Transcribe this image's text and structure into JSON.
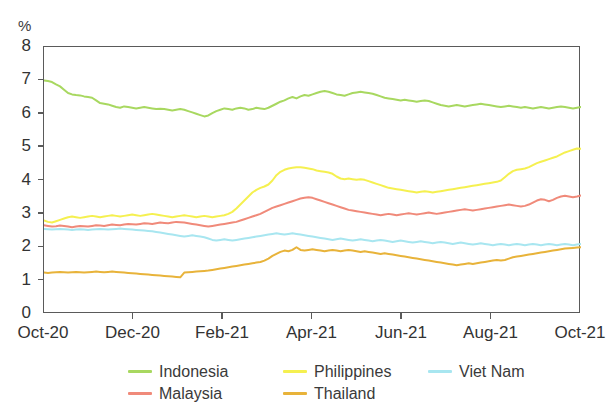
{
  "unit_label": "%",
  "chart_data": {
    "type": "line",
    "title": "",
    "subtitle": "",
    "xlabel": "",
    "ylabel": "%",
    "ylim": [
      0,
      8
    ],
    "ytick_labels": [
      "0",
      "1",
      "2",
      "3",
      "4",
      "5",
      "6",
      "7",
      "8"
    ],
    "ytick_values": [
      0,
      1,
      2,
      3,
      4,
      5,
      6,
      7,
      8
    ],
    "xtick_labels": [
      "Oct-20",
      "Dec-20",
      "Feb-21",
      "Apr-21",
      "Jun-21",
      "Aug-21",
      "Oct-21"
    ],
    "xtick_positions": [
      0,
      2,
      4,
      6,
      8,
      10,
      12
    ],
    "xlim": [
      0,
      12
    ],
    "grid": false,
    "legend_position": "bottom",
    "series": [
      {
        "name": "Indonesia",
        "color": "#a8d860",
        "values": [
          7.0,
          6.98,
          6.95,
          6.88,
          6.82,
          6.72,
          6.62,
          6.58,
          6.56,
          6.55,
          6.52,
          6.5,
          6.48,
          6.4,
          6.32,
          6.3,
          6.28,
          6.24,
          6.2,
          6.18,
          6.22,
          6.2,
          6.18,
          6.16,
          6.18,
          6.2,
          6.18,
          6.16,
          6.14,
          6.15,
          6.14,
          6.12,
          6.1,
          6.12,
          6.14,
          6.12,
          6.08,
          6.04,
          6.0,
          5.96,
          5.92,
          5.95,
          6.02,
          6.08,
          6.12,
          6.16,
          6.14,
          6.12,
          6.16,
          6.18,
          6.16,
          6.12,
          6.14,
          6.18,
          6.16,
          6.14,
          6.18,
          6.24,
          6.3,
          6.36,
          6.4,
          6.46,
          6.5,
          6.46,
          6.52,
          6.56,
          6.54,
          6.58,
          6.62,
          6.66,
          6.68,
          6.66,
          6.62,
          6.58,
          6.56,
          6.54,
          6.58,
          6.62,
          6.64,
          6.66,
          6.64,
          6.62,
          6.6,
          6.56,
          6.52,
          6.48,
          6.46,
          6.44,
          6.42,
          6.4,
          6.42,
          6.4,
          6.38,
          6.36,
          6.38,
          6.4,
          6.38,
          6.34,
          6.3,
          6.26,
          6.24,
          6.22,
          6.24,
          6.26,
          6.24,
          6.22,
          6.24,
          6.26,
          6.28,
          6.3,
          6.28,
          6.26,
          6.24,
          6.22,
          6.2,
          6.22,
          6.24,
          6.22,
          6.2,
          6.18,
          6.2,
          6.18,
          6.16,
          6.18,
          6.2,
          6.18,
          6.16,
          6.18,
          6.2,
          6.22,
          6.2,
          6.18,
          6.16,
          6.18,
          6.2
        ]
      },
      {
        "name": "Malaysia",
        "color": "#f08a7a",
        "values": [
          2.66,
          2.64,
          2.62,
          2.63,
          2.65,
          2.64,
          2.62,
          2.6,
          2.62,
          2.64,
          2.63,
          2.62,
          2.64,
          2.66,
          2.65,
          2.64,
          2.66,
          2.68,
          2.67,
          2.66,
          2.68,
          2.7,
          2.69,
          2.68,
          2.7,
          2.72,
          2.71,
          2.7,
          2.72,
          2.74,
          2.73,
          2.72,
          2.74,
          2.76,
          2.75,
          2.74,
          2.72,
          2.7,
          2.68,
          2.66,
          2.64,
          2.62,
          2.64,
          2.66,
          2.68,
          2.7,
          2.72,
          2.74,
          2.76,
          2.8,
          2.84,
          2.88,
          2.92,
          2.96,
          3.0,
          3.06,
          3.12,
          3.18,
          3.22,
          3.26,
          3.3,
          3.34,
          3.38,
          3.42,
          3.46,
          3.48,
          3.5,
          3.48,
          3.44,
          3.4,
          3.36,
          3.32,
          3.28,
          3.24,
          3.2,
          3.16,
          3.12,
          3.1,
          3.08,
          3.06,
          3.04,
          3.02,
          3.0,
          2.98,
          2.96,
          2.98,
          3.0,
          2.98,
          2.96,
          2.98,
          3.0,
          3.02,
          3.0,
          2.98,
          3.0,
          3.02,
          3.04,
          3.02,
          3.0,
          3.02,
          3.04,
          3.06,
          3.08,
          3.1,
          3.12,
          3.14,
          3.12,
          3.1,
          3.12,
          3.14,
          3.16,
          3.18,
          3.2,
          3.22,
          3.24,
          3.26,
          3.28,
          3.26,
          3.24,
          3.22,
          3.24,
          3.28,
          3.34,
          3.4,
          3.44,
          3.42,
          3.38,
          3.42,
          3.48,
          3.52,
          3.54,
          3.52,
          3.5,
          3.52,
          3.55
        ]
      },
      {
        "name": "Philippines",
        "color": "#f5f050",
        "values": [
          2.8,
          2.76,
          2.74,
          2.78,
          2.82,
          2.86,
          2.9,
          2.92,
          2.9,
          2.88,
          2.9,
          2.92,
          2.94,
          2.92,
          2.9,
          2.92,
          2.94,
          2.96,
          2.94,
          2.92,
          2.94,
          2.96,
          2.98,
          2.96,
          2.94,
          2.96,
          2.98,
          3.0,
          2.98,
          2.96,
          2.94,
          2.92,
          2.9,
          2.92,
          2.94,
          2.96,
          2.94,
          2.92,
          2.9,
          2.92,
          2.94,
          2.92,
          2.9,
          2.92,
          2.94,
          2.96,
          3.0,
          3.06,
          3.16,
          3.28,
          3.4,
          3.52,
          3.64,
          3.72,
          3.78,
          3.82,
          3.88,
          4.0,
          4.16,
          4.26,
          4.32,
          4.36,
          4.38,
          4.4,
          4.4,
          4.38,
          4.36,
          4.34,
          4.3,
          4.28,
          4.26,
          4.24,
          4.2,
          4.12,
          4.06,
          4.04,
          4.06,
          4.04,
          4.02,
          4.04,
          4.02,
          3.98,
          3.94,
          3.9,
          3.86,
          3.82,
          3.78,
          3.76,
          3.74,
          3.72,
          3.7,
          3.68,
          3.66,
          3.64,
          3.66,
          3.68,
          3.66,
          3.64,
          3.66,
          3.68,
          3.7,
          3.72,
          3.74,
          3.76,
          3.78,
          3.8,
          3.82,
          3.84,
          3.86,
          3.88,
          3.9,
          3.92,
          3.94,
          3.96,
          4.0,
          4.1,
          4.2,
          4.28,
          4.32,
          4.34,
          4.36,
          4.4,
          4.46,
          4.52,
          4.56,
          4.6,
          4.64,
          4.68,
          4.72,
          4.78,
          4.84,
          4.88,
          4.92,
          4.96,
          4.95
        ]
      },
      {
        "name": "Thailand",
        "color": "#e8b33a",
        "values": [
          1.24,
          1.23,
          1.24,
          1.25,
          1.26,
          1.25,
          1.24,
          1.25,
          1.26,
          1.25,
          1.24,
          1.25,
          1.26,
          1.27,
          1.26,
          1.25,
          1.26,
          1.27,
          1.26,
          1.25,
          1.24,
          1.23,
          1.22,
          1.21,
          1.2,
          1.19,
          1.18,
          1.17,
          1.16,
          1.15,
          1.14,
          1.13,
          1.12,
          1.11,
          1.1,
          1.24,
          1.25,
          1.26,
          1.27,
          1.28,
          1.29,
          1.3,
          1.32,
          1.34,
          1.36,
          1.38,
          1.4,
          1.42,
          1.44,
          1.46,
          1.48,
          1.5,
          1.52,
          1.54,
          1.56,
          1.6,
          1.66,
          1.74,
          1.8,
          1.86,
          1.9,
          1.88,
          1.92,
          2.0,
          1.92,
          1.9,
          1.92,
          1.94,
          1.92,
          1.9,
          1.88,
          1.9,
          1.92,
          1.9,
          1.88,
          1.9,
          1.92,
          1.9,
          1.88,
          1.86,
          1.88,
          1.86,
          1.84,
          1.82,
          1.8,
          1.82,
          1.8,
          1.78,
          1.76,
          1.74,
          1.72,
          1.7,
          1.68,
          1.66,
          1.64,
          1.62,
          1.6,
          1.58,
          1.56,
          1.54,
          1.52,
          1.5,
          1.48,
          1.46,
          1.48,
          1.5,
          1.52,
          1.5,
          1.52,
          1.54,
          1.56,
          1.58,
          1.6,
          1.62,
          1.6,
          1.62,
          1.66,
          1.7,
          1.72,
          1.74,
          1.76,
          1.78,
          1.8,
          1.82,
          1.84,
          1.86,
          1.88,
          1.9,
          1.92,
          1.94,
          1.96,
          1.97,
          1.98,
          1.99,
          2.0
        ]
      },
      {
        "name": "Viet Nam",
        "color": "#a8e6f0",
        "values": [
          2.55,
          2.54,
          2.53,
          2.54,
          2.55,
          2.54,
          2.53,
          2.52,
          2.53,
          2.54,
          2.53,
          2.52,
          2.53,
          2.54,
          2.55,
          2.54,
          2.53,
          2.54,
          2.55,
          2.56,
          2.55,
          2.54,
          2.53,
          2.52,
          2.51,
          2.5,
          2.49,
          2.48,
          2.46,
          2.44,
          2.42,
          2.4,
          2.38,
          2.36,
          2.34,
          2.32,
          2.34,
          2.36,
          2.34,
          2.32,
          2.3,
          2.26,
          2.22,
          2.2,
          2.22,
          2.24,
          2.22,
          2.2,
          2.22,
          2.24,
          2.26,
          2.28,
          2.3,
          2.32,
          2.34,
          2.36,
          2.38,
          2.4,
          2.42,
          2.4,
          2.38,
          2.4,
          2.42,
          2.4,
          2.38,
          2.36,
          2.34,
          2.32,
          2.3,
          2.28,
          2.26,
          2.24,
          2.22,
          2.24,
          2.26,
          2.24,
          2.22,
          2.2,
          2.22,
          2.24,
          2.22,
          2.2,
          2.18,
          2.2,
          2.22,
          2.2,
          2.18,
          2.16,
          2.18,
          2.2,
          2.18,
          2.16,
          2.14,
          2.16,
          2.18,
          2.16,
          2.14,
          2.12,
          2.14,
          2.16,
          2.14,
          2.12,
          2.1,
          2.12,
          2.14,
          2.12,
          2.1,
          2.08,
          2.1,
          2.12,
          2.1,
          2.08,
          2.06,
          2.08,
          2.1,
          2.08,
          2.06,
          2.08,
          2.1,
          2.08,
          2.06,
          2.08,
          2.1,
          2.08,
          2.06,
          2.08,
          2.1,
          2.08,
          2.06,
          2.08,
          2.1,
          2.08,
          2.06,
          2.08,
          2.1
        ]
      }
    ]
  },
  "legend": {
    "items": [
      {
        "label": "Indonesia",
        "color": "#a8d860",
        "col": 0,
        "row": 0
      },
      {
        "label": "Malaysia",
        "color": "#f08a7a",
        "col": 0,
        "row": 1
      },
      {
        "label": "Philippines",
        "color": "#f5f050",
        "col": 1,
        "row": 0
      },
      {
        "label": "Thailand",
        "color": "#e8b33a",
        "col": 1,
        "row": 1
      },
      {
        "label": "Viet Nam",
        "color": "#a8e6f0",
        "col": 2,
        "row": 0
      }
    ]
  }
}
